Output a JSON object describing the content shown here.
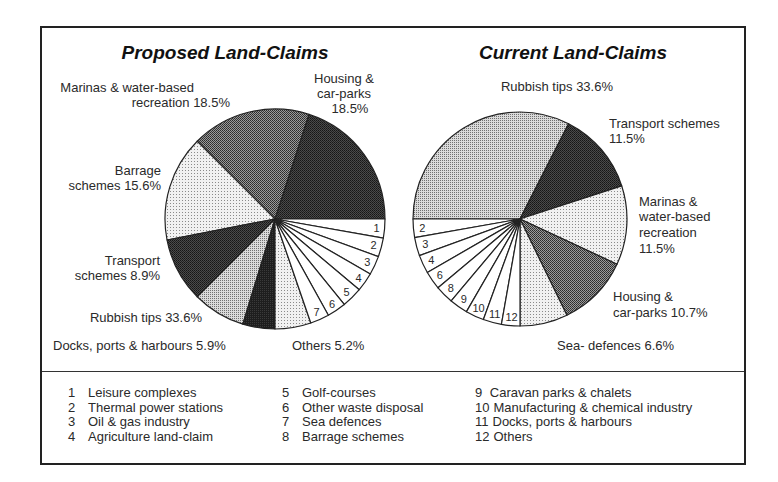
{
  "chart_data": [
    {
      "type": "pie",
      "title": "Proposed Land-Claims",
      "slices": [
        {
          "label": "Housing & car-parks",
          "value": 18.5,
          "pattern": "dark"
        },
        {
          "label": "Marinas & water-based recreation",
          "value": 18.5,
          "pattern": "medium-dark"
        },
        {
          "label": "Barrage schemes",
          "value": 15.6,
          "pattern": "light"
        },
        {
          "label": "Transport schemes",
          "value": 8.9,
          "pattern": "dark"
        },
        {
          "label": "Rubbish tips",
          "value": 33.6,
          "pattern": "medium"
        },
        {
          "label": "Docks, ports & harbours",
          "value": 5.9,
          "pattern": "black"
        },
        {
          "label": "Others",
          "value": 5.2,
          "pattern": "light"
        },
        {
          "label": "7",
          "value": null,
          "pattern": "white"
        },
        {
          "label": "6",
          "value": null,
          "pattern": "white"
        },
        {
          "label": "5",
          "value": null,
          "pattern": "white"
        },
        {
          "label": "4",
          "value": null,
          "pattern": "white"
        },
        {
          "label": "3",
          "value": null,
          "pattern": "white"
        },
        {
          "label": "2",
          "value": null,
          "pattern": "white"
        },
        {
          "label": "1",
          "value": null,
          "pattern": "white"
        }
      ]
    },
    {
      "type": "pie",
      "title": "Current Land-Claims",
      "slices": [
        {
          "label": "Rubbish tips",
          "value": 33.6,
          "pattern": "medium"
        },
        {
          "label": "Transport schemes",
          "value": 11.5,
          "pattern": "dark"
        },
        {
          "label": "Marinas & water-based recreation",
          "value": 11.5,
          "pattern": "light"
        },
        {
          "label": "Housing & car-parks",
          "value": 10.7,
          "pattern": "medium-dark"
        },
        {
          "label": "Sea- defences",
          "value": 6.6,
          "pattern": "light"
        },
        {
          "label": "12",
          "value": null,
          "pattern": "white"
        },
        {
          "label": "11",
          "value": null,
          "pattern": "white"
        },
        {
          "label": "10",
          "value": null,
          "pattern": "white"
        },
        {
          "label": "9",
          "value": null,
          "pattern": "white"
        },
        {
          "label": "8",
          "value": null,
          "pattern": "white"
        },
        {
          "label": "6",
          "value": null,
          "pattern": "white"
        },
        {
          "label": "4",
          "value": null,
          "pattern": "white"
        },
        {
          "label": "3",
          "value": null,
          "pattern": "white"
        },
        {
          "label": "2",
          "value": null,
          "pattern": "white"
        }
      ]
    }
  ],
  "proposed": {
    "title": "Proposed Land-Claims",
    "labels": {
      "marinas_1": "Marinas & water-based",
      "marinas_2": "recreation 18.5%",
      "housing_1": "Housing &",
      "housing_2": "car-parks",
      "housing_3": "18.5%",
      "barrage_1": "Barrage",
      "barrage_2": "schemes 15.6%",
      "transport_1": "Transport",
      "transport_2": "schemes 8.9%",
      "rubbish": "Rubbish tips 33.6%",
      "docks": "Docks, ports & harbours 5.9%",
      "others": "Others 5.2%"
    },
    "small_slice_numbers": [
      "1",
      "2",
      "3",
      "4",
      "5",
      "6",
      "7"
    ]
  },
  "current": {
    "title": "Current Land-Claims",
    "labels": {
      "rubbish": "Rubbish tips 33.6%",
      "transport_1": "Transport schemes",
      "transport_2": "11.5%",
      "marinas_1": "Marinas &",
      "marinas_2": "water-based",
      "marinas_3": "recreation",
      "marinas_4": "11.5%",
      "housing_1": "Housing &",
      "housing_2": "car-parks 10.7%",
      "sea": "Sea- defences 6.6%"
    },
    "small_slice_numbers": [
      "2",
      "3",
      "4",
      "6",
      "8",
      "9",
      "10",
      "11",
      "12"
    ]
  },
  "legend": {
    "columns": [
      [
        {
          "num": "1",
          "text": "Leisure complexes"
        },
        {
          "num": "2",
          "text": "Thermal power stations"
        },
        {
          "num": "3",
          "text": "Oil & gas industry"
        },
        {
          "num": "4",
          "text": "Agriculture land-claim"
        }
      ],
      [
        {
          "num": "5",
          "text": "Golf-courses"
        },
        {
          "num": "6",
          "text": "Other waste disposal"
        },
        {
          "num": "7",
          "text": "Sea defences"
        },
        {
          "num": "8",
          "text": "Barrage schemes"
        }
      ],
      [
        {
          "num": "9",
          "text": " Caravan parks & chalets"
        },
        {
          "num": "10",
          "text": "Manufacturing & chemical industry"
        },
        {
          "num": "11",
          "text": "Docks, ports & harbours"
        },
        {
          "num": "12",
          "text": "Others"
        }
      ]
    ]
  }
}
